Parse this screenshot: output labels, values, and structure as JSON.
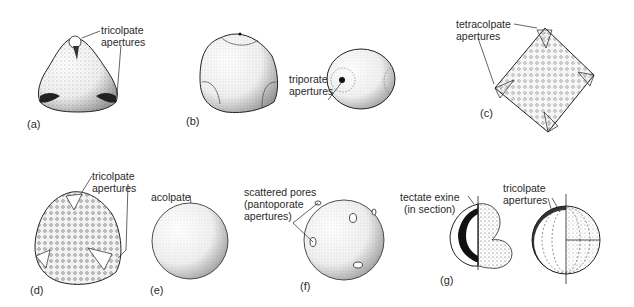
{
  "figure": {
    "panels": [
      {
        "id": "a",
        "tag": "(a)",
        "labels": [
          "tricolpate",
          "apertures"
        ]
      },
      {
        "id": "b",
        "tag": "(b)",
        "labels": [
          "triporate",
          "apertures"
        ]
      },
      {
        "id": "c",
        "tag": "(c)",
        "labels": [
          "tetracolpate",
          "apertures"
        ]
      },
      {
        "id": "d",
        "tag": "(d)",
        "labels": [
          "tricolpate",
          "apertures"
        ]
      },
      {
        "id": "e",
        "tag": "(e)",
        "labels": [
          "acolpate"
        ]
      },
      {
        "id": "f",
        "tag": "(f)",
        "labels": [
          "scattered pores",
          "(pantoporate",
          "apertures)"
        ]
      },
      {
        "id": "g",
        "tag": "(g)",
        "labels": [
          "tectate exine",
          "(in section)",
          "tricolpate",
          "apertures"
        ]
      }
    ]
  },
  "colors": {
    "ink": "#1a1a1a",
    "paper": "#ffffff",
    "stipple": "#555555"
  }
}
